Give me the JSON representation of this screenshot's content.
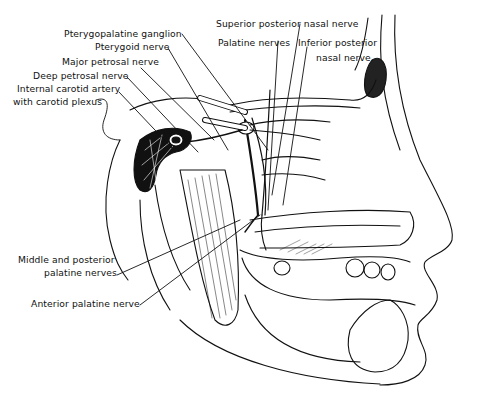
{
  "figure": {
    "labels": [
      {
        "id": "pterygopalatine-ganglion",
        "text": "Pterygopalatine ganglion",
        "x": 64,
        "y": 28
      },
      {
        "id": "pterygoid-nerve",
        "text": "Pterygoid nerve",
        "x": 95,
        "y": 41
      },
      {
        "id": "major-petrosal-nerve",
        "text": "Major petrosal nerve",
        "x": 62,
        "y": 56
      },
      {
        "id": "deep-petrosal-nerve",
        "text": "Deep petrosal nerve",
        "x": 33,
        "y": 70
      },
      {
        "id": "internal-carotid-artery-line1",
        "text": "Internal carotid artery",
        "x": 17,
        "y": 83
      },
      {
        "id": "internal-carotid-artery-line2",
        "text": "with carotid plexus",
        "x": 13,
        "y": 96
      },
      {
        "id": "superior-posterior-nasal-nerve",
        "text": "Superior posterior nasal nerve",
        "x": 216,
        "y": 18
      },
      {
        "id": "palatine-nerves",
        "text": "Palatine nerves",
        "x": 218,
        "y": 37
      },
      {
        "id": "inferior-posterior-nasal-line1",
        "text": "Inferior posterior",
        "x": 298,
        "y": 37
      },
      {
        "id": "inferior-posterior-nasal-line2",
        "text": "nasal nerve",
        "x": 316,
        "y": 52
      },
      {
        "id": "middle-posterior-palatine-line1",
        "text": "Middle and posterior",
        "x": 18,
        "y": 254
      },
      {
        "id": "middle-posterior-palatine-line2",
        "text": "palatine nerves",
        "x": 44,
        "y": 267
      },
      {
        "id": "anterior-palatine-nerve",
        "text": "Anterior palatine nerve",
        "x": 31,
        "y": 298
      }
    ]
  }
}
